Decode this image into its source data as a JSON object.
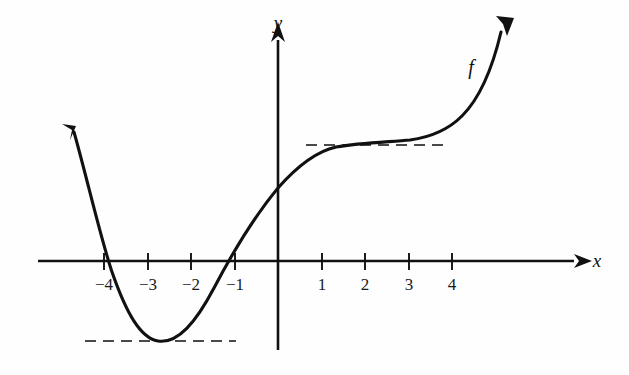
{
  "figure": {
    "title": "",
    "background_color": "#fefefe",
    "ink_color": "#111111",
    "dash_color": "#4a4a4a"
  },
  "axes": {
    "x_axis": {
      "label": "x",
      "label_position": {
        "x": 597,
        "y": 266
      },
      "line_y": 261,
      "x_start": 38,
      "x_end": 578,
      "arrow": "right",
      "tick_labels": [
        "−4",
        "−3",
        "−2",
        "−1",
        "1",
        "2",
        "3",
        "4"
      ],
      "tick_values": [
        -4,
        -3,
        -2,
        -1,
        1,
        2,
        3,
        4
      ],
      "tick_pixels": [
        104,
        148,
        191,
        235,
        322,
        365,
        409,
        452
      ],
      "tick_label_y": 285
    },
    "y_axis": {
      "label": "y",
      "label_position": {
        "x": 278,
        "y": 27
      },
      "line_x": 278,
      "y_top": 25,
      "y_bottom": 350,
      "arrow": "up",
      "tick_labels": [],
      "tick_values": []
    },
    "origin_pixel": {
      "x": 278,
      "y": 261
    },
    "unit_px": 43.6
  },
  "curve": {
    "name": "f",
    "label": "f",
    "label_position": {
      "x": 471,
      "y": 72
    },
    "stroke_width": 3.1,
    "description": "Graph of a smooth function f with a local minimum near x = -2.75, rising through a root near x = -4 and another near x = -1.3, an inflection plateau near x = 1.5 to x = 3, then increasing steeply after x = 4.",
    "features": {
      "local_minimum": {
        "x": -2.75,
        "y_pixel": 341
      },
      "roots_approx": [
        -4.0,
        -1.35
      ],
      "y_intercept_pixel": 188,
      "plateau_pixel_y": 145,
      "left_arrow_tip": {
        "x": 68,
        "y": 124
      },
      "right_arrow_tip": {
        "x": 512,
        "y": 16
      }
    },
    "path": "M 74,132 C 88,182 100,236 112,272 C 126,312 140,338 158,341 C 178,344 196,322 214,288 C 236,246 258,212 278,188 C 300,163 318,151 336,147 C 360,143 388,142 410,140 C 432,137 448,130 462,116 C 478,100 492,70 501,32"
  },
  "dashed_lines": [
    {
      "name": "plateau-guide",
      "y": 145,
      "x_start": 306,
      "x_end": 449,
      "meaning": "horizontal tangent guide at the inflection plateau"
    },
    {
      "name": "minimum-guide",
      "y": 341,
      "x_start": 85,
      "x_end": 236,
      "meaning": "horizontal tangent guide at the local minimum"
    }
  ],
  "chart_data": {
    "type": "line",
    "title": "",
    "xlabel": "x",
    "ylabel": "y",
    "legend": [
      "f"
    ],
    "grid": false,
    "xlim": [
      -5.5,
      6.9
    ],
    "tick_labels_x": [
      "−4",
      "−3",
      "−2",
      "−1",
      "1",
      "2",
      "3",
      "4"
    ],
    "tick_labels_y": [],
    "annotations": [
      "f"
    ],
    "series": [
      {
        "name": "f",
        "x": [
          -4.7,
          -4.4,
          -4.0,
          -3.6,
          -3.2,
          -2.75,
          -2.4,
          -2.0,
          -1.6,
          -1.35,
          -1.0,
          -0.5,
          0.0,
          0.5,
          1.0,
          1.5,
          2.0,
          2.5,
          3.0,
          3.5,
          4.0,
          4.4,
          4.8,
          5.1
        ],
        "y": [
          2.95,
          1.8,
          0.0,
          -1.1,
          -1.75,
          -1.85,
          -1.6,
          -1.0,
          -0.35,
          0.0,
          0.5,
          1.1,
          1.68,
          2.1,
          2.45,
          2.6,
          2.68,
          2.72,
          2.75,
          2.85,
          3.1,
          3.7,
          4.9,
          5.3
        ]
      }
    ]
  }
}
